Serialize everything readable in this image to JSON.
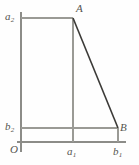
{
  "figure": {
    "type": "geometric-diagram",
    "title": "",
    "background_color": "#fefefe",
    "line_color_axis": "#8c8c88",
    "line_color_grid": "#9a9a95",
    "line_color_diagonal": "#3b3a37",
    "labels": {
      "a2": {
        "base": "a",
        "sub": "2"
      },
      "a1": {
        "base": "a",
        "sub": "1"
      },
      "b2": {
        "base": "b",
        "sub": "2"
      },
      "b1": {
        "base": "b",
        "sub": "1"
      },
      "A": {
        "base": "A",
        "sub": ""
      },
      "B": {
        "base": "B",
        "sub": ""
      },
      "O": {
        "base": "O",
        "sub": ""
      }
    },
    "points": {
      "O": {
        "x": 21,
        "y": 142
      },
      "A": {
        "x": 73,
        "y": 18
      },
      "B": {
        "x": 118,
        "y": 128
      },
      "a1_axis": {
        "x": 73,
        "y": 142
      },
      "b1_axis": {
        "x": 118,
        "y": 142
      },
      "a2_axis": {
        "x": 21,
        "y": 18
      },
      "b2_axis": {
        "x": 21,
        "y": 128
      }
    },
    "segments": [
      {
        "name": "y-axis",
        "x1": 21,
        "y1": 12,
        "x2": 21,
        "y2": 152,
        "color": "#8c8c88",
        "width": 1.4
      },
      {
        "name": "x-axis",
        "x1": 17,
        "y1": 142,
        "x2": 126,
        "y2": 142,
        "color": "#8c8c88",
        "width": 1.4
      },
      {
        "name": "a2-horizontal",
        "x1": 21,
        "y1": 18,
        "x2": 73,
        "y2": 18,
        "color": "#9a9a95",
        "width": 1.1
      },
      {
        "name": "b2-horizontal",
        "x1": 21,
        "y1": 128,
        "x2": 118,
        "y2": 128,
        "color": "#9a9a95",
        "width": 1.1
      },
      {
        "name": "a1-vertical",
        "x1": 73,
        "y1": 18,
        "x2": 73,
        "y2": 142,
        "color": "#9a9a95",
        "width": 1.1
      },
      {
        "name": "b1-vertical",
        "x1": 118,
        "y1": 128,
        "x2": 118,
        "y2": 142,
        "color": "#9a9a95",
        "width": 1.1
      },
      {
        "name": "segment-AB",
        "x1": 73,
        "y1": 18,
        "x2": 118,
        "y2": 128,
        "color": "#3b3a37",
        "width": 1.6
      }
    ]
  }
}
